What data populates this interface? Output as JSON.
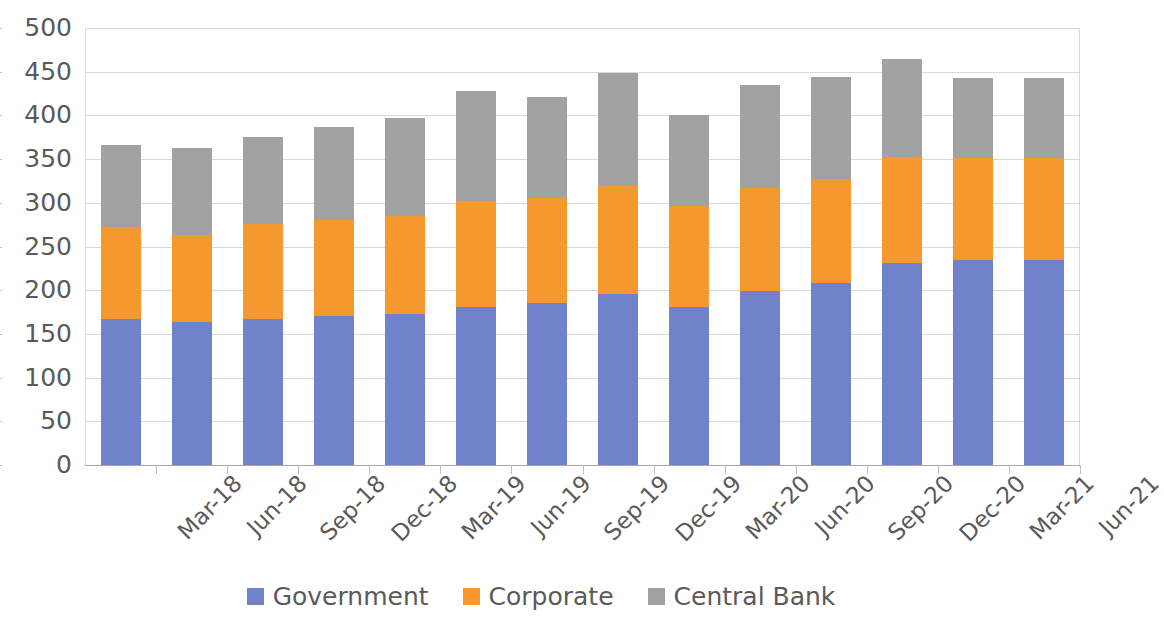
{
  "chart_data": {
    "type": "bar",
    "subtype": "stacked-bar",
    "title": "",
    "subtitle": "",
    "xlabel": "",
    "ylabel": "",
    "ylim": [
      0,
      500
    ],
    "ytick_step": 50,
    "yticks": [
      500,
      450,
      400,
      350,
      300,
      250,
      200,
      150,
      100,
      50,
      0
    ],
    "grid": true,
    "legend_position": "bottom",
    "categories": [
      "Mar-18",
      "Jun-18",
      "Sep-18",
      "Dec-18",
      "Mar-19",
      "Jun-19",
      "Sep-19",
      "Dec-19",
      "Mar-20",
      "Jun-20",
      "Sep-20",
      "Dec-20",
      "Mar-21",
      "Jun-21"
    ],
    "series": [
      {
        "name": "Government",
        "color": "#7083ca",
        "values": [
          167,
          164,
          167,
          170,
          173,
          181,
          185,
          196,
          181,
          199,
          208,
          231,
          234,
          234
        ]
      },
      {
        "name": "Corporate",
        "color": "#f5982e",
        "values": [
          105,
          99,
          109,
          110,
          112,
          121,
          120,
          123,
          115,
          118,
          119,
          121,
          117,
          117
        ]
      },
      {
        "name": "Central Bank",
        "color": "#a2a2a2",
        "values": [
          94,
          100,
          99,
          107,
          112,
          126,
          116,
          129,
          105,
          118,
          117,
          113,
          92,
          92
        ]
      }
    ],
    "totals": [
      366,
      363,
      375,
      387,
      397,
      428,
      421,
      448,
      401,
      435,
      444,
      465,
      443,
      443
    ]
  },
  "legend": {
    "items": [
      {
        "label": "Government",
        "color": "#7083ca",
        "swatch": "legend-swatch-government"
      },
      {
        "label": "Corporate",
        "color": "#f5982e",
        "swatch": "legend-swatch-corporate"
      },
      {
        "label": "Central Bank",
        "color": "#a2a2a2",
        "swatch": "legend-swatch-central-bank"
      }
    ]
  }
}
